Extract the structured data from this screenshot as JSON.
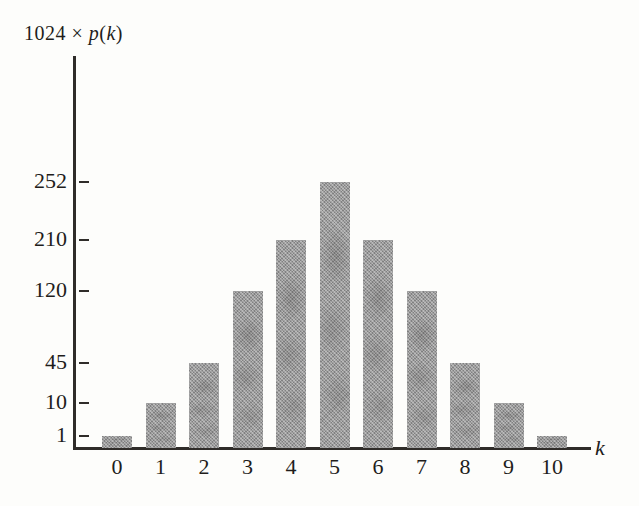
{
  "figure": {
    "background": "#fdfdfb",
    "axis_color": "#2f2c29",
    "text_color": "#1f1d1b",
    "bar_color": "#9d9d9d"
  },
  "chart_data": {
    "type": "bar",
    "title": "1024 × p(k)",
    "title_parts": [
      {
        "text": "1024 ",
        "italic": false
      },
      {
        "text": "× ",
        "italic": false
      },
      {
        "text": "p",
        "italic": true
      },
      {
        "text": "(",
        "italic": false
      },
      {
        "text": "k",
        "italic": true
      },
      {
        "text": ")",
        "italic": false
      }
    ],
    "xlabel": "k",
    "ylabel": "1024 × p(k)",
    "categories": [
      "0",
      "1",
      "2",
      "3",
      "4",
      "5",
      "6",
      "7",
      "8",
      "9",
      "10"
    ],
    "values": [
      1,
      10,
      45,
      120,
      210,
      252,
      210,
      120,
      45,
      10,
      1
    ],
    "y_ticks": [
      1,
      10,
      45,
      120,
      210,
      252
    ],
    "y_scale": "nonlinear; tick marks sit at the exact heights of the matching bar tops",
    "grid": false,
    "legend": "none",
    "layout": {
      "value_to_px_height": {
        "1": 11,
        "10": 44,
        "45": 84,
        "120": 156,
        "210": 207,
        "252": 265
      },
      "baseline_y": 447,
      "first_bar_center_x": 117,
      "bar_spacing_x": 43.5,
      "bar_width": 30
    }
  }
}
